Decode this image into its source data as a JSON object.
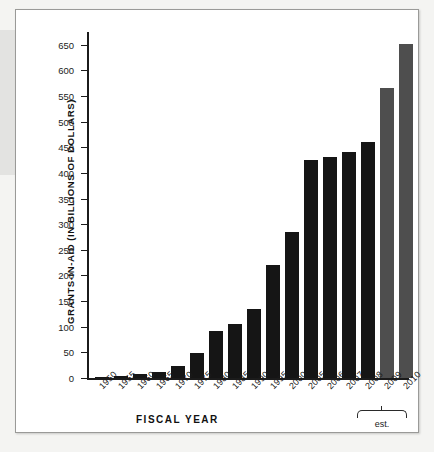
{
  "figure": {
    "background_color": "#ffffff",
    "border_color": "#9a9a98"
  },
  "chart_data": {
    "type": "bar",
    "title": "",
    "xlabel": "FISCAL YEAR",
    "ylabel": "GRANTS-IN-AID (IN BILLIONS OF DOLLARS)",
    "categories": [
      "1950",
      "1955",
      "1960",
      "1965",
      "1970",
      "1975",
      "1980",
      "1985",
      "1990",
      "1995",
      "2000",
      "2005",
      "2006",
      "2007",
      "2008",
      "2009",
      "2010"
    ],
    "values": [
      2,
      3,
      7,
      11,
      24,
      49,
      91,
      106,
      135,
      221,
      284,
      425,
      432,
      441,
      460,
      565,
      651
    ],
    "ylim": [
      0,
      675
    ],
    "yticks": [
      0,
      50,
      100,
      150,
      200,
      250,
      300,
      350,
      400,
      450,
      500,
      550,
      600,
      650
    ],
    "ytick_labels": [
      "0",
      "50",
      "100",
      "150",
      "200",
      "250",
      "300",
      "350",
      "400",
      "450",
      "500",
      "550",
      "600",
      "650"
    ],
    "grid": false,
    "legend": "none",
    "series": [
      {
        "name": "Grants-in-aid",
        "values": [
          2,
          3,
          7,
          11,
          24,
          49,
          91,
          106,
          135,
          221,
          284,
          425,
          432,
          441,
          460,
          565,
          651
        ],
        "estimated_flags": [
          false,
          false,
          false,
          false,
          false,
          false,
          false,
          false,
          false,
          false,
          false,
          false,
          false,
          false,
          false,
          true,
          true
        ]
      }
    ],
    "bar_color_actual": "#151515",
    "bar_color_estimated": "#4e4e4e",
    "annotations": [
      {
        "text": "est.",
        "applies_to": [
          "2009",
          "2010"
        ]
      }
    ]
  }
}
